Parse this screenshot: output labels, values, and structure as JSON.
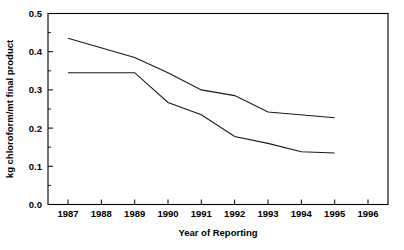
{
  "chart_data": {
    "type": "line",
    "title": "",
    "xlabel": "Year of Reporting",
    "ylabel": "kg chloroform/mt final product",
    "xlim": [
      1986.4,
      1996.6
    ],
    "ylim": [
      0.0,
      0.5
    ],
    "grid": false,
    "legend": "none",
    "x_tick_labels": [
      "1987",
      "1988",
      "1989",
      "1990",
      "1991",
      "1992",
      "1993",
      "1994",
      "1995",
      "1996"
    ],
    "x_ticks": [
      1987,
      1988,
      1989,
      1990,
      1991,
      1992,
      1993,
      1994,
      1995,
      1996
    ],
    "y_tick_labels": [
      "0.0",
      "0.1",
      "0.2",
      "0.3",
      "0.4",
      "0.5"
    ],
    "y_ticks": [
      0.0,
      0.1,
      0.2,
      0.3,
      0.4,
      0.5
    ],
    "y_minor_ticks": [
      0.05,
      0.15,
      0.25,
      0.35,
      0.45
    ],
    "series": [
      {
        "name": "upper-series",
        "color": "#1a1a1a",
        "x": [
          1987,
          1989,
          1990,
          1991,
          1992,
          1993,
          1995
        ],
        "values": [
          0.435,
          0.385,
          0.345,
          0.3,
          0.285,
          0.242,
          0.227
        ]
      },
      {
        "name": "lower-series",
        "color": "#1a1a1a",
        "x": [
          1987,
          1989,
          1990,
          1991,
          1992,
          1993,
          1994,
          1995
        ],
        "values": [
          0.345,
          0.345,
          0.267,
          0.235,
          0.178,
          0.16,
          0.138,
          0.135
        ]
      }
    ]
  }
}
